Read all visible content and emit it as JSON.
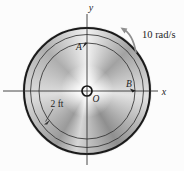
{
  "figure": {
    "angular_velocity": {
      "label": "10 rad/s",
      "direction": "counterclockwise"
    },
    "radius_dim": {
      "label": "2 ft"
    },
    "axes": {
      "x_label": "x",
      "y_label": "y"
    },
    "points": {
      "origin_label": "O",
      "top_label": "A",
      "right_label": "B"
    },
    "colors": {
      "line": "#333333",
      "thin_circle": "#2b2b2b",
      "rim": "#1a1a1a",
      "rotation_arrow": "#8f8f8f",
      "text": "#1e1e1e",
      "background": "#fcfcfc"
    }
  }
}
